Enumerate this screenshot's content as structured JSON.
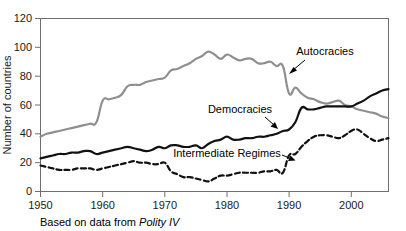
{
  "chart_data": {
    "type": "line",
    "title": "",
    "xlabel": "",
    "ylabel": "Number of countries",
    "caption_prefix": "Based on data from ",
    "caption_source": "Polity IV",
    "xlim": [
      1950,
      2006
    ],
    "ylim": [
      0,
      120
    ],
    "grid": false,
    "legend": "inline-annotations",
    "x_ticks": [
      "1950",
      "1960",
      "1970",
      "1980",
      "1990",
      "2000"
    ],
    "x_tick_values": [
      1950,
      1960,
      1970,
      1980,
      1990,
      2000
    ],
    "y_ticks": [
      "0",
      "20",
      "40",
      "60",
      "80",
      "100",
      "120"
    ],
    "y_tick_values": [
      0,
      20,
      40,
      60,
      80,
      100,
      120
    ],
    "x": [
      1950,
      1951,
      1952,
      1953,
      1954,
      1955,
      1956,
      1957,
      1958,
      1959,
      1960,
      1961,
      1962,
      1963,
      1964,
      1965,
      1966,
      1967,
      1968,
      1969,
      1970,
      1971,
      1972,
      1973,
      1974,
      1975,
      1976,
      1977,
      1978,
      1979,
      1980,
      1981,
      1982,
      1983,
      1984,
      1985,
      1986,
      1987,
      1988,
      1989,
      1990,
      1991,
      1992,
      1993,
      1994,
      1995,
      1996,
      1997,
      1998,
      1999,
      2000,
      2001,
      2002,
      2003,
      2004,
      2005,
      2006
    ],
    "series": [
      {
        "name": "Autocracies",
        "color": "#8f8f8f",
        "style": "solid",
        "width": 2.2,
        "values": [
          38,
          40,
          41,
          42,
          43,
          44,
          45,
          46,
          47,
          48,
          63,
          64,
          65,
          67,
          73,
          74,
          74,
          76,
          77,
          78,
          79,
          84,
          85,
          87,
          89,
          92,
          94,
          97,
          95,
          92,
          95,
          93,
          91,
          92,
          92,
          89,
          89,
          90,
          87,
          87,
          68,
          72,
          68,
          65,
          64,
          62,
          61,
          62,
          63,
          60,
          59,
          57,
          56,
          55,
          54,
          52,
          51
        ]
      },
      {
        "name": "Democracies",
        "color": "#111111",
        "style": "solid",
        "width": 2.2,
        "values": [
          23,
          24,
          25,
          26,
          26,
          27,
          27,
          28,
          28,
          26,
          27,
          28,
          29,
          30,
          31,
          30,
          29,
          28,
          29,
          31,
          30,
          32,
          32,
          31,
          31,
          32,
          30,
          33,
          35,
          36,
          38,
          36,
          36,
          37,
          37,
          38,
          38,
          39,
          40,
          42,
          43,
          48,
          58,
          57,
          57,
          58,
          59,
          59,
          59,
          59,
          59,
          61,
          63,
          66,
          68,
          70,
          71
        ]
      },
      {
        "name": "Intermediate Regimes",
        "color": "#111111",
        "style": "dashed",
        "width": 2.2,
        "values": [
          18,
          17,
          16,
          15,
          15,
          15,
          16,
          16,
          16,
          15,
          16,
          17,
          18,
          19,
          20,
          21,
          20,
          20,
          19,
          19,
          20,
          14,
          12,
          10,
          10,
          9,
          8,
          7,
          9,
          11,
          11,
          12,
          13,
          13,
          13,
          13,
          14,
          14,
          15,
          13,
          25,
          26,
          31,
          35,
          38,
          39,
          39,
          38,
          37,
          39,
          42,
          43,
          40,
          37,
          35,
          36,
          37
        ]
      }
    ],
    "annotations": [
      {
        "label": "Autocracies",
        "text_x": 325,
        "text_y": 55,
        "anchor": "middle"
      },
      {
        "label": "Democracies",
        "text_x": 240,
        "text_y": 113,
        "anchor": "middle"
      },
      {
        "label": "Intermediate Regimes",
        "text_x": 235,
        "text_y": 157,
        "anchor": "middle"
      }
    ]
  }
}
